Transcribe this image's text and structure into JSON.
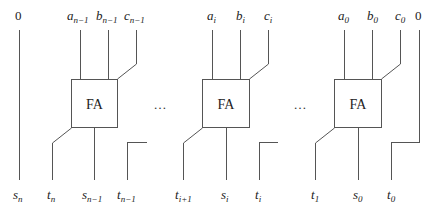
{
  "diagram": {
    "block_label": "FA",
    "ellipsis": "…",
    "left_zero": "0",
    "right_zero": "0",
    "blocks": [
      {
        "inputs": {
          "a": {
            "base": "a",
            "sub": "n−1"
          },
          "b": {
            "base": "b",
            "sub": "n−1"
          },
          "c": {
            "base": "c",
            "sub": "n−1"
          }
        },
        "outputs": {
          "t_out": {
            "base": "t",
            "sub": "n"
          },
          "s": {
            "base": "s",
            "sub": "n−1"
          },
          "t_in": {
            "base": "t",
            "sub": "n−1"
          }
        }
      },
      {
        "inputs": {
          "a": {
            "base": "a",
            "sub": "i"
          },
          "b": {
            "base": "b",
            "sub": "i"
          },
          "c": {
            "base": "c",
            "sub": "i"
          }
        },
        "outputs": {
          "t_out": {
            "base": "t",
            "sub": "i+1"
          },
          "s": {
            "base": "s",
            "sub": "i"
          },
          "t_in": {
            "base": "t",
            "sub": "i"
          }
        }
      },
      {
        "inputs": {
          "a": {
            "base": "a",
            "sub": "0"
          },
          "b": {
            "base": "b",
            "sub": "0"
          },
          "c": {
            "base": "c",
            "sub": "0"
          }
        },
        "outputs": {
          "t_out": {
            "base": "t",
            "sub": "1"
          },
          "s": {
            "base": "s",
            "sub": "0"
          },
          "t_in": {
            "base": "t",
            "sub": "0"
          }
        }
      }
    ],
    "left_output": {
      "base": "s",
      "sub": "n"
    },
    "colors": {
      "line": "#555555",
      "text": "#222222",
      "background": "#ffffff"
    }
  }
}
